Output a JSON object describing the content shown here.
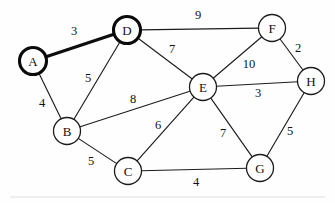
{
  "figure": {
    "background_color": "#fefefe",
    "ink_color": "#1c1c1c",
    "highlight_color": "#0a0a0a"
  },
  "chart_data": {
    "type": "diagram",
    "title": "",
    "graph_kind": "undirected-weighted-graph",
    "nodes": [
      {
        "id": "A",
        "label": "A",
        "x": 33,
        "y": 61,
        "r": 13.5,
        "highlighted": true
      },
      {
        "id": "B",
        "label": "B",
        "x": 67,
        "y": 131,
        "r": 13.5,
        "highlighted": false
      },
      {
        "id": "C",
        "label": "C",
        "x": 128,
        "y": 171,
        "r": 13.5,
        "highlighted": false
      },
      {
        "id": "D",
        "label": "D",
        "x": 127,
        "y": 30,
        "r": 13.5,
        "highlighted": true
      },
      {
        "id": "E",
        "label": "E",
        "x": 203,
        "y": 87,
        "r": 13.5,
        "highlighted": false
      },
      {
        "id": "F",
        "label": "F",
        "x": 272,
        "y": 28,
        "r": 13.5,
        "highlighted": false
      },
      {
        "id": "G",
        "label": "G",
        "x": 260,
        "y": 168,
        "r": 13.5,
        "highlighted": false
      },
      {
        "id": "H",
        "label": "H",
        "x": 311,
        "y": 81,
        "r": 13.5,
        "highlighted": false
      }
    ],
    "edges": [
      {
        "from": "A",
        "to": "D",
        "weight": 3,
        "label_x": 74,
        "label_y": 31,
        "highlighted": true
      },
      {
        "from": "A",
        "to": "B",
        "weight": 4,
        "label_x": 42,
        "label_y": 103,
        "highlighted": false
      },
      {
        "from": "B",
        "to": "D",
        "weight": 5,
        "label_x": 88,
        "label_y": 78,
        "highlighted": false
      },
      {
        "from": "B",
        "to": "E",
        "weight": 8,
        "label_x": 133,
        "label_y": 99,
        "highlighted": false
      },
      {
        "from": "B",
        "to": "C",
        "weight": 5,
        "label_x": 91,
        "label_y": 161,
        "highlighted": false
      },
      {
        "from": "D",
        "to": "F",
        "weight": 9,
        "label_x": 198,
        "label_y": 15,
        "highlighted": false
      },
      {
        "from": "D",
        "to": "E",
        "weight": 7,
        "label_x": 172,
        "label_y": 49,
        "highlighted": false
      },
      {
        "from": "C",
        "to": "E",
        "weight": 6,
        "label_x": 158,
        "label_y": 125,
        "highlighted": false
      },
      {
        "from": "C",
        "to": "G",
        "weight": 4,
        "label_x": 196,
        "label_y": 182,
        "highlighted": false
      },
      {
        "from": "E",
        "to": "F",
        "weight": 10,
        "label_x": 249,
        "label_y": 64,
        "highlighted": false
      },
      {
        "from": "E",
        "to": "H",
        "weight": 3,
        "label_x": 258,
        "label_y": 93,
        "highlighted": false
      },
      {
        "from": "E",
        "to": "G",
        "weight": 7,
        "label_x": 223,
        "label_y": 133,
        "highlighted": false
      },
      {
        "from": "F",
        "to": "H",
        "weight": 2,
        "label_x": 298,
        "label_y": 48,
        "highlighted": false
      },
      {
        "from": "G",
        "to": "H",
        "weight": 5,
        "label_x": 290,
        "label_y": 131,
        "highlighted": false
      }
    ],
    "legend": [],
    "annotations": []
  }
}
